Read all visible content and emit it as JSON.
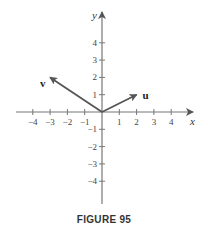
{
  "figure": {
    "caption": "FIGURE 95",
    "axes": {
      "x_label": "x",
      "y_label": "y",
      "x_ticks": [
        -4,
        -3,
        -2,
        -1,
        1,
        2,
        3,
        4
      ],
      "y_ticks": [
        -4,
        -3,
        -2,
        -1,
        1,
        2,
        3,
        4
      ],
      "x_tick_labels": [
        "−4",
        "−3",
        "−2",
        "−1",
        "1",
        "2",
        "3",
        "4"
      ],
      "y_tick_labels": [
        "−4",
        "−3",
        "−2",
        "−1",
        "1",
        "2",
        "3",
        "4"
      ]
    },
    "vectors": [
      {
        "name": "u",
        "label": "u",
        "x": 2,
        "y": 1
      },
      {
        "name": "v",
        "label": "v",
        "x": -3,
        "y": 2
      }
    ],
    "colors": {
      "axis": "#777777",
      "vector": "#555555",
      "text": "#333333"
    }
  }
}
